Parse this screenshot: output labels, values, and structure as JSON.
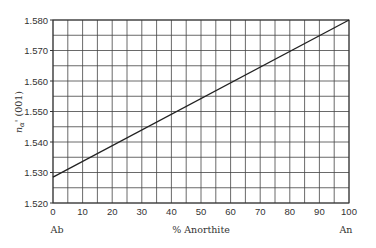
{
  "chart_data": {
    "type": "line",
    "title": "",
    "xlabel": "% Anorthite",
    "ylabel": "nα' (001)",
    "ylabel_parts": {
      "symbol": "n",
      "subscript": "α",
      "suffix": "' (001)"
    },
    "x_end_labels": {
      "left": "Ab",
      "right": "An"
    },
    "xlim": [
      0,
      100
    ],
    "ylim": [
      1.52,
      1.58
    ],
    "x_ticks": [
      0,
      10,
      20,
      30,
      40,
      50,
      60,
      70,
      80,
      90,
      100
    ],
    "x_tick_labels": [
      "0",
      "10",
      "20",
      "30",
      "40",
      "50",
      "60",
      "70",
      "80",
      "90",
      "100"
    ],
    "y_ticks": [
      1.52,
      1.53,
      1.54,
      1.55,
      1.56,
      1.57,
      1.58
    ],
    "y_tick_labels": [
      "1.520",
      "1.530",
      "1.540",
      "1.550",
      "1.560",
      "1.570",
      "1.580"
    ],
    "grid": true,
    "grid_minor_x_step": 5,
    "grid_minor_y_step": 0.005,
    "legend": null,
    "series": [
      {
        "name": "nα' (001)",
        "x": [
          0,
          100
        ],
        "values": [
          1.5285,
          1.58
        ],
        "color": "#222222"
      }
    ]
  }
}
